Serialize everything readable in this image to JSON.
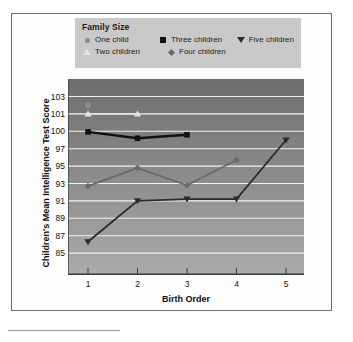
{
  "chart_data": {
    "type": "line",
    "title": "",
    "xlabel": "Birth Order",
    "ylabel": "Children's Mean Intelligence Test Score",
    "x": [
      1,
      2,
      3,
      4,
      5
    ],
    "xtick_labels": [
      "1",
      "2",
      "3",
      "4",
      "5"
    ],
    "ytick_labels": [
      "103",
      "101",
      "100",
      "97",
      "95",
      "93",
      "91",
      "89",
      "87",
      "85"
    ],
    "ytick_values": [
      103,
      101,
      100,
      97,
      95,
      93,
      91,
      89,
      87,
      85
    ],
    "ylim": [
      84,
      104
    ],
    "grid": true,
    "legend_position": "top",
    "legend_title": "Family Size",
    "series": [
      {
        "name": "One child",
        "marker": "circle",
        "color": "#8c8c8c",
        "x": [
          1
        ],
        "values": [
          102.0
        ]
      },
      {
        "name": "Two children",
        "marker": "triangle-up",
        "color": "#e3e3e3",
        "x": [
          1,
          2
        ],
        "values": [
          101.0,
          101.0
        ]
      },
      {
        "name": "Three children",
        "marker": "square",
        "color": "#111111",
        "x": [
          1,
          2,
          3
        ],
        "values": [
          99.9,
          98.8,
          99.4
        ]
      },
      {
        "name": "Four children",
        "marker": "diamond",
        "color": "#6a6a6a",
        "x": [
          1,
          2,
          3,
          4
        ],
        "values": [
          92.7,
          94.8,
          92.8,
          95.7
        ]
      },
      {
        "name": "Five children",
        "marker": "triangle-down",
        "color": "#2b2b2b",
        "x": [
          1,
          2,
          3,
          4,
          5
        ],
        "values": [
          86.3,
          91.0,
          91.2,
          91.2,
          98.5
        ]
      }
    ]
  },
  "legend": {
    "title": "Family Size",
    "entries": [
      {
        "label": "One child",
        "marker": "circle"
      },
      {
        "label": "Three children",
        "marker": "square"
      },
      {
        "label": "Five children",
        "marker": "triangle-down"
      },
      {
        "label": "Two children",
        "marker": "triangle-up"
      },
      {
        "label": "Four children",
        "marker": "diamond"
      }
    ]
  },
  "axes": {
    "x_title": "Birth Order",
    "y_title": "Children's Mean Intelligence Test Score"
  },
  "colors": {
    "plot_background_top": "#6f6f6f",
    "plot_background_bottom": "#a9a9a9",
    "gridline": "#f2f2f2",
    "legend_background": "#c9c9c9",
    "frame_border": "#6e6e6e",
    "page_background": "#ffffff"
  }
}
